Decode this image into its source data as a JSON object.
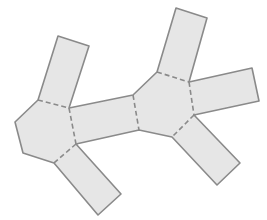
{
  "diagram": {
    "type": "net",
    "colors": {
      "background": "#ffffff",
      "face_fill": "#e6e6e6",
      "edge_stroke": "#8a8a8a"
    },
    "faces": [
      {
        "id": "left-hexagon",
        "shape": "hexagon",
        "points": "38,100 69,108 76,144 54,163 23,153 15,122"
      },
      {
        "id": "right-hexagon",
        "shape": "hexagon",
        "points": "157,72 189,82 194,115 172,137 139,130 133,95"
      },
      {
        "id": "left-top-rect",
        "shape": "rectangle",
        "points": "58,36 89,46 69,108 38,100"
      },
      {
        "id": "middle-rect",
        "shape": "rectangle",
        "points": "69,108 133,95 139,130 76,144"
      },
      {
        "id": "left-bottom-rect",
        "shape": "rectangle",
        "points": "76,144 121,194 98,215 54,163"
      },
      {
        "id": "right-top-rect",
        "shape": "rectangle",
        "points": "176,8 207,18 189,82 157,72"
      },
      {
        "id": "right-side-rect",
        "shape": "rectangle",
        "points": "189,82 252,68 259,101 194,115"
      },
      {
        "id": "right-bottom-rect",
        "shape": "rectangle",
        "points": "194,115 240,163 217,185 172,137"
      }
    ],
    "fold_lines": [
      {
        "id": "fold-left-top",
        "x1": 38,
        "y1": 100,
        "x2": 69,
        "y2": 108
      },
      {
        "id": "fold-left-middle",
        "x1": 69,
        "y1": 108,
        "x2": 76,
        "y2": 144
      },
      {
        "id": "fold-left-bottom",
        "x1": 76,
        "y1": 144,
        "x2": 54,
        "y2": 163
      },
      {
        "id": "fold-right-middle",
        "x1": 133,
        "y1": 95,
        "x2": 139,
        "y2": 130
      },
      {
        "id": "fold-right-top",
        "x1": 157,
        "y1": 72,
        "x2": 189,
        "y2": 82
      },
      {
        "id": "fold-right-side",
        "x1": 189,
        "y1": 82,
        "x2": 194,
        "y2": 115
      },
      {
        "id": "fold-right-bottom",
        "x1": 194,
        "y1": 115,
        "x2": 172,
        "y2": 137
      }
    ],
    "outline": "58,36 89,46 69,108 133,95 157,72 176,8 207,18 189,82 252,68 259,101 194,115 240,163 217,185 172,137 139,130 76,144 121,194 98,215 54,163 23,153 15,122 38,100"
  }
}
